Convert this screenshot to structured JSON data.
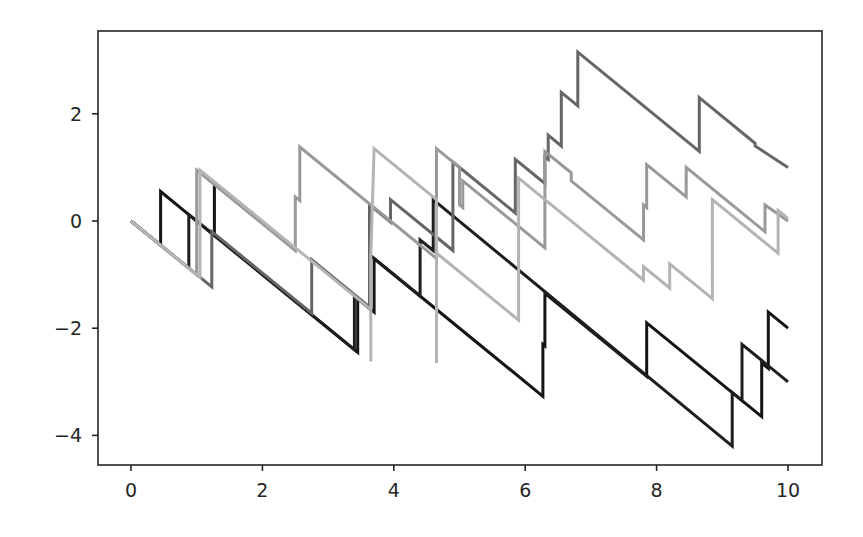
{
  "chart_data": {
    "type": "line",
    "title": "",
    "xlabel": "",
    "ylabel": "",
    "xlim": [
      -0.5,
      10.5
    ],
    "ylim": [
      -4.6,
      3.5
    ],
    "grid": false,
    "legend": null,
    "xticks": [
      0,
      2,
      4,
      6,
      8,
      10
    ],
    "xtick_labels": [
      "0",
      "2",
      "4",
      "6",
      "8",
      "10"
    ],
    "yticks": [
      2,
      0,
      -2,
      -4
    ],
    "ytick_labels": [
      "2",
      "0",
      "−2",
      "−4"
    ],
    "series": [
      {
        "name": "path-1",
        "color": "#141414",
        "points": [
          [
            0,
            0
          ],
          [
            0.45,
            -0.45
          ],
          [
            0.45,
            0.55
          ],
          [
            0.88,
            0.12
          ],
          [
            1.27,
            -0.27
          ],
          [
            1.27,
            0.68
          ],
          [
            1.27,
            -0.27
          ],
          [
            3.45,
            -2.45
          ],
          [
            3.45,
            -1.45
          ],
          [
            3.7,
            -1.7
          ],
          [
            3.7,
            -0.7
          ],
          [
            6.27,
            -3.27
          ],
          [
            6.27,
            -2.3
          ],
          [
            6.3,
            -2.33
          ],
          [
            6.3,
            -1.35
          ],
          [
            7.85,
            -2.9
          ],
          [
            7.85,
            -1.9
          ],
          [
            9.6,
            -3.65
          ],
          [
            9.6,
            -2.65
          ],
          [
            9.7,
            -2.75
          ],
          [
            9.7,
            -1.7
          ],
          [
            10,
            -2.0
          ]
        ]
      },
      {
        "name": "path-2",
        "color": "#1e1e1e",
        "points": [
          [
            0,
            0
          ],
          [
            0.88,
            -0.88
          ],
          [
            0.88,
            0.12
          ],
          [
            3.4,
            -2.4
          ],
          [
            3.4,
            -1.4
          ],
          [
            3.63,
            -1.63
          ],
          [
            3.63,
            -0.63
          ],
          [
            4.4,
            -1.4
          ],
          [
            4.4,
            -0.35
          ],
          [
            4.6,
            -0.55
          ],
          [
            4.6,
            0.4
          ],
          [
            9.15,
            -4.2
          ],
          [
            9.15,
            -3.2
          ],
          [
            9.3,
            -3.35
          ],
          [
            9.3,
            -2.3
          ],
          [
            10,
            -3.0
          ]
        ]
      },
      {
        "name": "path-3",
        "color": "#666666",
        "points": [
          [
            0,
            0
          ],
          [
            1.23,
            -1.23
          ],
          [
            1.23,
            -0.2
          ],
          [
            2.75,
            -1.72
          ],
          [
            2.75,
            -0.72
          ],
          [
            3.63,
            -1.6
          ],
          [
            3.63,
            0.3
          ],
          [
            3.95,
            -0.02
          ],
          [
            3.95,
            0.4
          ],
          [
            4.9,
            -0.55
          ],
          [
            4.9,
            1.1
          ],
          [
            5.85,
            0.15
          ],
          [
            5.85,
            1.15
          ],
          [
            6.3,
            0.7
          ],
          [
            6.3,
            1.2
          ],
          [
            6.35,
            1.15
          ],
          [
            6.35,
            1.6
          ],
          [
            6.55,
            1.4
          ],
          [
            6.55,
            2.4
          ],
          [
            6.8,
            2.15
          ],
          [
            6.8,
            3.15
          ],
          [
            8.65,
            1.3
          ],
          [
            8.65,
            2.3
          ],
          [
            9.5,
            1.45
          ],
          [
            9.5,
            1.4
          ],
          [
            10,
            1.0
          ]
        ]
      },
      {
        "name": "path-4",
        "color": "#999999",
        "points": [
          [
            0,
            0
          ],
          [
            1.0,
            -1.0
          ],
          [
            1.0,
            0.95
          ],
          [
            2.5,
            -0.55
          ],
          [
            2.5,
            0.45
          ],
          [
            2.57,
            0.38
          ],
          [
            2.57,
            1.38
          ],
          [
            4.65,
            -0.7
          ],
          [
            4.65,
            1.35
          ],
          [
            5.0,
            1.0
          ],
          [
            5.0,
            0.3
          ],
          [
            5.05,
            0.25
          ],
          [
            5.05,
            0.75
          ],
          [
            6.3,
            -0.5
          ],
          [
            6.3,
            1.3
          ],
          [
            6.7,
            0.9
          ],
          [
            6.7,
            0.75
          ],
          [
            7.8,
            -0.35
          ],
          [
            7.8,
            0.3
          ],
          [
            7.85,
            0.25
          ],
          [
            7.85,
            1.05
          ],
          [
            8.45,
            0.45
          ],
          [
            8.45,
            1.0
          ],
          [
            9.65,
            -0.2
          ],
          [
            9.65,
            0.3
          ],
          [
            10,
            0.0
          ]
        ]
      },
      {
        "name": "path-5",
        "color": "#b4b4b4",
        "points": [
          [
            0,
            0
          ],
          [
            1.05,
            -1.05
          ],
          [
            1.05,
            0.95
          ],
          [
            2.5,
            -0.5
          ],
          [
            3.65,
            -1.65
          ],
          [
            3.65,
            -2.62
          ],
          [
            3.65,
            -0.65
          ],
          [
            3.7,
            1.35
          ],
          [
            4.65,
            0.4
          ],
          [
            4.65,
            -2.65
          ],
          [
            4.65,
            -0.6
          ],
          [
            4.7,
            -0.65
          ],
          [
            5.9,
            -1.85
          ],
          [
            5.9,
            0.8
          ],
          [
            7.8,
            -1.1
          ],
          [
            7.8,
            -0.85
          ],
          [
            8.2,
            -1.25
          ],
          [
            8.2,
            -0.8
          ],
          [
            8.85,
            -1.45
          ],
          [
            8.85,
            0.4
          ],
          [
            9.85,
            -0.6
          ],
          [
            9.85,
            0.2
          ],
          [
            10,
            0.05
          ]
        ]
      }
    ]
  }
}
